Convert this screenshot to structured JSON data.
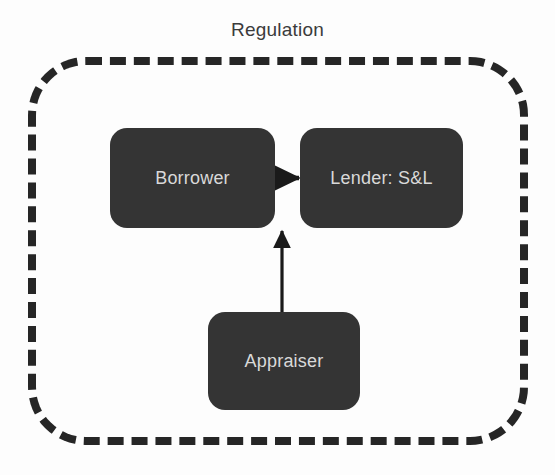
{
  "diagram": {
    "title": "Regulation",
    "title_color": "#3b3b3b",
    "background_color": "#fdfdfd",
    "boundary": {
      "label": "Regulation",
      "style": "dashed",
      "color": "#262626",
      "shape": "rounded-rectangle"
    },
    "node_fill_color": "#343434",
    "node_text_color": "#d9d9d9",
    "edge_color": "#1a1a1a",
    "nodes": [
      {
        "id": "borrower",
        "label": "Borrower"
      },
      {
        "id": "lender",
        "label": "Lender: S&L"
      },
      {
        "id": "appraiser",
        "label": "Appraiser"
      }
    ],
    "edges": [
      {
        "from": "Borrower",
        "to": "Lender: S&L",
        "direction": "right",
        "arrowhead": "filled-triangle"
      },
      {
        "from": "Appraiser",
        "to": "Lender: S&L",
        "direction": "up",
        "arrowhead": "filled-triangle"
      }
    ]
  }
}
